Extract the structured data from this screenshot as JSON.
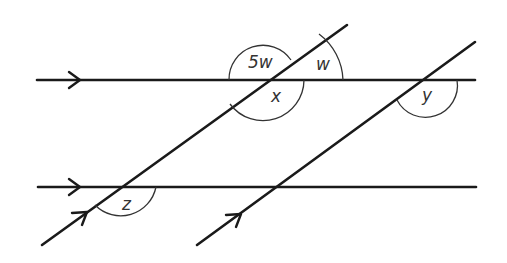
{
  "diagram": {
    "type": "parallel-lines-transversals",
    "colors": {
      "line": "#1a1a1a",
      "arc": "#333333",
      "label": "#333333",
      "background": "#ffffff"
    },
    "parallel_lines": [
      {
        "id": "top-horizontal",
        "x1": 37,
        "y1": 80,
        "x2": 475,
        "y2": 80,
        "arrow_at": [
          80,
          80
        ]
      },
      {
        "id": "bottom-horizontal",
        "x1": 38,
        "y1": 187,
        "x2": 476,
        "y2": 187,
        "arrow_at": [
          80,
          187
        ]
      }
    ],
    "transversals": [
      {
        "id": "transversal-left",
        "x1": 42,
        "y1": 245,
        "x2": 347,
        "y2": 25,
        "arrow_at": [
          88,
          212
        ]
      },
      {
        "id": "transversal-right",
        "x1": 197,
        "y1": 245,
        "x2": 475,
        "y2": 42,
        "arrow_at": [
          240,
          214
        ]
      }
    ],
    "angles": [
      {
        "label": "5w",
        "name": "angle-5w"
      },
      {
        "label": "w",
        "name": "angle-w"
      },
      {
        "label": "x",
        "name": "angle-x"
      },
      {
        "label": "y",
        "name": "angle-y"
      },
      {
        "label": "z",
        "name": "angle-z"
      }
    ]
  }
}
